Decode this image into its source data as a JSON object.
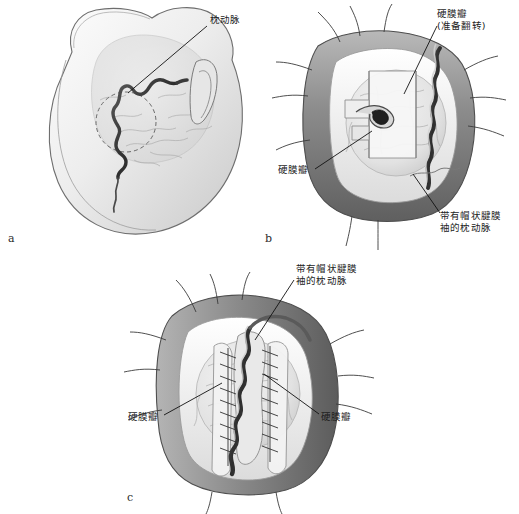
{
  "figure": {
    "background_color": "#ffffff",
    "ink_color": "#1d1d1d",
    "palette": {
      "scalp_flap_dark": "#6f6f6f",
      "scalp_flap_mid": "#8f8f8f",
      "scalp_flap_light": "#bdbdbd",
      "bone_light": "#efefef",
      "brain_light": "#e8e8e8",
      "artery_dark": "#3a3a3a",
      "leader_line": "#111111"
    }
  },
  "panels": [
    {
      "id": "a",
      "letter": "a",
      "letter_pos": {
        "x": 8,
        "y": 233
      },
      "caption_labels": [
        {
          "name": "occipital-artery",
          "text": "枕动脉",
          "text_pos": {
            "x": 210,
            "y": 14
          },
          "leader": {
            "x1": 207,
            "y1": 26,
            "x2": 128,
            "y2": 93
          }
        }
      ],
      "scene": "posterior head with scalp, ear, and course of the occipital artery marked on the skin; dashed circle indicates planned craniotomy"
    },
    {
      "id": "b",
      "letter": "b",
      "letter_pos": {
        "x": 265,
        "y": 233
      },
      "caption_labels": [
        {
          "name": "dural-flap-to-be-reflected",
          "text": "硬膜瓣\n(准备翻转)",
          "text_pos": {
            "x": 437,
            "y": 8
          },
          "leader": {
            "x1": 437,
            "y1": 26,
            "x2": 404,
            "y2": 94
          }
        },
        {
          "name": "dural-flap",
          "text": "硬膜瓣",
          "text_pos": {
            "x": 278,
            "y": 164
          },
          "leader": {
            "x1": 315,
            "y1": 169,
            "x2": 372,
            "y2": 131
          }
        },
        {
          "name": "occipital-artery-with-galeal-cuff",
          "text": "带有帽状腱膜\n袖的枕动脉",
          "text_pos": {
            "x": 440,
            "y": 210
          },
          "leader": {
            "x1": 440,
            "y1": 213,
            "x2": 413,
            "y2": 174
          }
        }
      ],
      "scene": "craniotomy exposed, scalp retracted with stay sutures, dura opened into flaps, occipital artery laid over cortex"
    },
    {
      "id": "c",
      "letter": "c",
      "letter_pos": {
        "x": 127,
        "y": 492
      },
      "caption_labels": [
        {
          "name": "occipital-artery-with-galeal-cuff",
          "text": "带有帽状腱膜\n袖的枕动脉",
          "text_pos": {
            "x": 296,
            "y": 263
          },
          "leader": {
            "x1": 294,
            "y1": 280,
            "x2": 255,
            "y2": 340
          }
        },
        {
          "name": "dural-flap-left",
          "text": "硬膜瓣",
          "text_pos": {
            "x": 128,
            "y": 411
          },
          "leader": {
            "x1": 164,
            "y1": 415,
            "x2": 222,
            "y2": 383
          }
        },
        {
          "name": "dural-flap-right",
          "text": "硬膜瓣",
          "text_pos": {
            "x": 321,
            "y": 411
          },
          "leader": {
            "x1": 319,
            "y1": 414,
            "x2": 264,
            "y2": 374
          }
        }
      ],
      "scene": "artery with galeal cuff sutured to both dural flap edges, continuous running suture lines on each side"
    }
  ]
}
